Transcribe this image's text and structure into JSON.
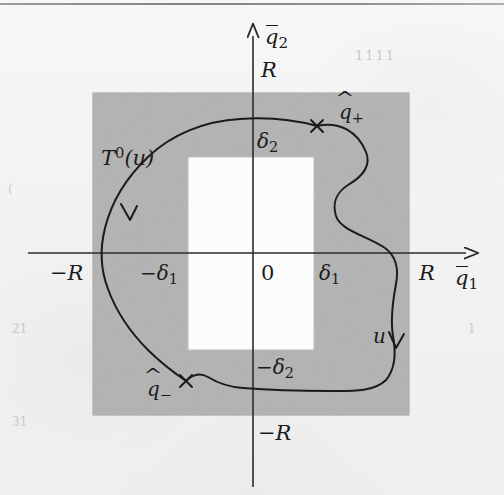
{
  "figure": {
    "type": "mathematical-diagram",
    "colors": {
      "background": "#f2f2f3",
      "shaded_region": "#b4b4b4",
      "inner_region": "#fdfdfd",
      "axis": "#2b2b2b",
      "curve": "#1b1b1b",
      "label": "#1b1b1b"
    },
    "axes": {
      "horizontal_label": "q̅1",
      "horizontal_label_base": "q",
      "horizontal_label_sub": "1",
      "vertical_label": "q̅2",
      "vertical_label_base": "q",
      "vertical_label_sub": "2",
      "origin_label": "0"
    },
    "tick_labels": {
      "x_neg_R": "−R",
      "x_pos_R": "R",
      "x_neg_delta1": "−δ₁",
      "x_neg_delta1_base": "−δ",
      "x_neg_delta1_sub": "1",
      "x_pos_delta1_base": "δ",
      "x_pos_delta1_sub": "1",
      "y_pos_R": "R",
      "y_neg_R": "−R",
      "y_pos_delta2_base": "δ",
      "y_pos_delta2_sub": "2",
      "y_neg_delta2_base": "−δ",
      "y_neg_delta2_sub": "2"
    },
    "curve_labels": {
      "trajectory_base": "T",
      "trajectory_sup": "0",
      "trajectory_arg": "(u)",
      "control_u": "u",
      "point_plus_base": "q",
      "point_plus_sub": "+",
      "point_minus_base": "q",
      "point_minus_sub": "−"
    },
    "markers": [
      {
        "name": "q-hat-plus",
        "x": 317,
        "y": 126
      },
      {
        "name": "q-hat-minus",
        "x": 186,
        "y": 381
      }
    ],
    "geometry": {
      "origin": [
        253,
        253
      ],
      "shaded_box": {
        "x": 93,
        "y": 93,
        "width": 316,
        "height": 322
      },
      "inner_box": {
        "x": 188,
        "y": 157,
        "width": 126,
        "height": 193
      },
      "x_axis_y": 253,
      "y_axis_x": 253,
      "x_axis_from": 28,
      "x_axis_to": 473,
      "y_axis_from": 30,
      "y_axis_to": 487
    },
    "arrows": [
      {
        "name": "trajectory-direction-left",
        "x": 128,
        "y": 215
      },
      {
        "name": "trajectory-direction-right",
        "x": 397,
        "y": 346
      }
    ]
  },
  "page_artifacts": {
    "margin_notes": [
      "1111",
      "1",
      "(",
      "21",
      "31",
      "1"
    ]
  }
}
